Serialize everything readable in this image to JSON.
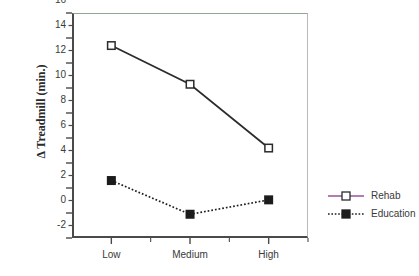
{
  "chart_data": {
    "type": "line",
    "title": "",
    "subtitle": "",
    "xlabel": "",
    "ylabel": "Δ  Treadmill  (min.)",
    "categories": [
      "Low",
      "Medium",
      "High"
    ],
    "series": [
      {
        "name": "Rehab",
        "values": [
          13.4,
          10.3,
          5.2
        ],
        "marker": "open-square",
        "line_style": "solid",
        "color": "#2b2b2b",
        "legend_line_color": "#9b4f9b"
      },
      {
        "name": "Education",
        "values": [
          2.6,
          -0.1,
          1.05
        ],
        "marker": "filled-square",
        "line_style": "dotted",
        "color": "#1c1c1c",
        "legend_line_color": "#1c1c1c"
      }
    ],
    "ylim": [
      -2,
      16
    ],
    "y_major_ticks": [
      -2,
      0,
      2,
      4,
      6,
      8,
      10,
      12,
      14,
      16
    ],
    "y_minor_ticks": [
      -1,
      1,
      3,
      5,
      7,
      9,
      11,
      13,
      15
    ],
    "y_tick_labels": [
      "-2",
      "0",
      "2",
      "4",
      "6",
      "8",
      "10",
      "12",
      "14",
      "16"
    ],
    "x_tick_labels": [
      "Low",
      "Medium",
      "High"
    ],
    "grid": false,
    "legend_position": "right",
    "legend_entries": [
      "Rehab",
      "Education"
    ]
  },
  "axes": {
    "top_border_color": "#8fa98f",
    "axis_color": "#4a4a4a"
  }
}
